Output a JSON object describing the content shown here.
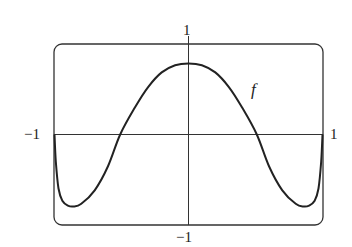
{
  "chart_data": {
    "type": "line",
    "title": "",
    "xlabel": "",
    "ylabel": "",
    "xlim": [
      -1,
      1
    ],
    "ylim": [
      -1,
      1
    ],
    "grid": false,
    "frame": "rounded-rectangle",
    "tick_labels": {
      "x_left": "−1",
      "x_right": "1",
      "y_top": "1",
      "y_bottom": "−1"
    },
    "series": [
      {
        "name": "f",
        "label": "f",
        "x": [
          -1.0,
          -0.99,
          -0.97,
          -0.94,
          -0.9,
          -0.86,
          -0.8,
          -0.7,
          -0.6,
          -0.51,
          -0.4,
          -0.3,
          -0.2,
          -0.1,
          0.0,
          0.1,
          0.2,
          0.3,
          0.4,
          0.51,
          0.6,
          0.7,
          0.8,
          0.86,
          0.9,
          0.94,
          0.97,
          0.99,
          1.0
        ],
        "y": [
          0.0,
          -0.3,
          -0.6,
          -0.74,
          -0.79,
          -0.8,
          -0.77,
          -0.62,
          -0.35,
          0.0,
          0.3,
          0.53,
          0.69,
          0.77,
          0.79,
          0.77,
          0.69,
          0.53,
          0.3,
          0.0,
          -0.35,
          -0.62,
          -0.77,
          -0.8,
          -0.79,
          -0.74,
          -0.6,
          -0.3,
          0.0
        ]
      }
    ],
    "annotations": [
      {
        "text": "f",
        "x": 0.72,
        "y": 0.5
      }
    ]
  },
  "labels": {
    "x_left": "−1",
    "x_right": "1",
    "y_top": "1",
    "y_bottom": "−1",
    "function": "f"
  },
  "colors": {
    "curve": "#222222",
    "axes": "#333333",
    "frame": "#333333",
    "background": "#ffffff"
  }
}
